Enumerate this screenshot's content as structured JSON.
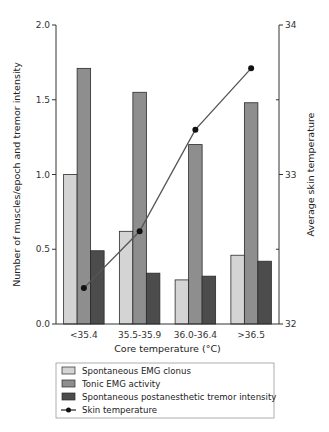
{
  "chart_data": {
    "type": "bar",
    "title": "",
    "xlabel": "Core temperature (°C)",
    "ylabel": "Number of muscles/epoch and tremor intensity",
    "y2label": "Average skin temperature",
    "categories": [
      "<35.4",
      "35.5-35.9",
      "36.0-36.4",
      ">36.5"
    ],
    "ylim": [
      0,
      2.0
    ],
    "yticks": [
      0.0,
      0.5,
      1.0,
      1.5,
      2.0
    ],
    "ytick_labels": [
      "0.0",
      "0.5",
      "1.0",
      "1.5",
      "2.0"
    ],
    "y2lim": [
      32,
      34
    ],
    "y2ticks": [
      32,
      33,
      34
    ],
    "y2tick_labels": [
      "32",
      "33",
      "34"
    ],
    "y2minor_ticks": [
      32.5,
      33.5
    ],
    "grid": false,
    "legend_position": "bottom",
    "series": [
      {
        "name": "Spontaneous EMG clonus",
        "type": "bar",
        "axis": "left",
        "color": "#d4d4d4",
        "values": [
          1.0,
          0.62,
          0.295,
          0.46
        ]
      },
      {
        "name": "Tonic EMG activity",
        "type": "bar",
        "axis": "left",
        "color": "#8e8e8e",
        "values": [
          1.71,
          1.55,
          1.2,
          1.48
        ]
      },
      {
        "name": "Spontaneous postanesthetic tremor intensity",
        "type": "bar",
        "axis": "left",
        "color": "#4c4c4c",
        "values": [
          0.49,
          0.34,
          0.32,
          0.42
        ]
      },
      {
        "name": "Skin temperature",
        "type": "line",
        "axis": "right",
        "color": "#555555",
        "marker": "circle",
        "values": [
          32.24,
          32.62,
          33.3,
          33.71
        ]
      }
    ]
  }
}
